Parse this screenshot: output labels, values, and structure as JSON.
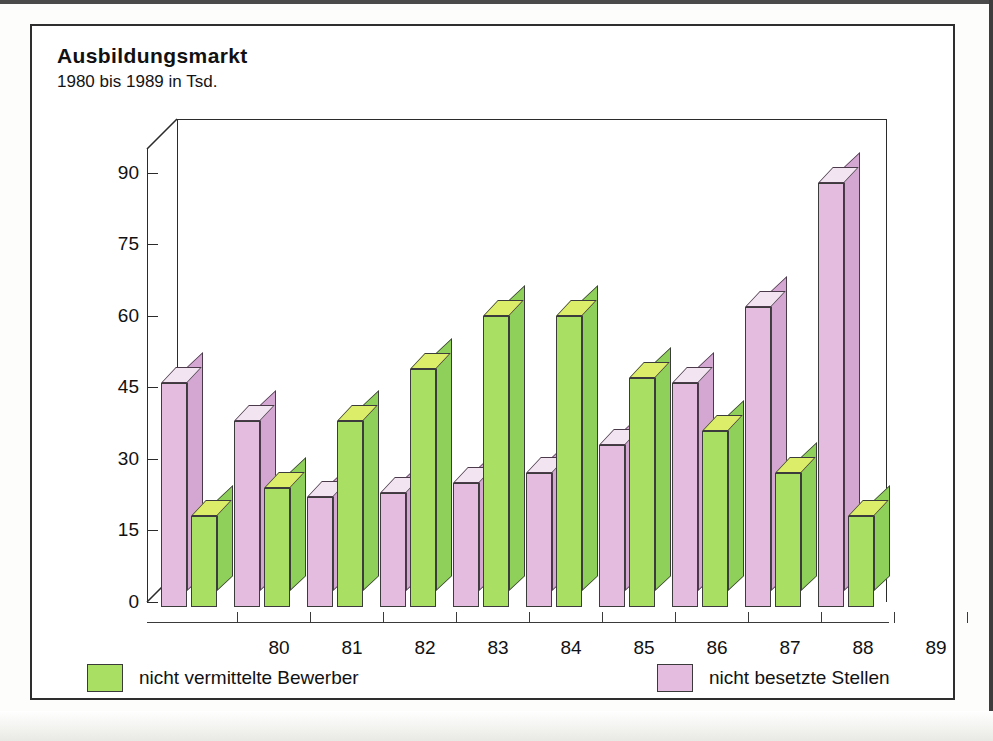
{
  "title": "Ausbildungsmarkt",
  "subtitle": "1980 bis 1989 in Tsd.",
  "legend": {
    "items": [
      {
        "label": "nicht vermittelte Bewerber",
        "color": "#a9e063",
        "key": "bewerber"
      },
      {
        "label": "nicht besetzte Stellen",
        "color": "#e3bce0",
        "key": "stellen"
      }
    ]
  },
  "chart_data": {
    "type": "bar",
    "title": "Ausbildungsmarkt",
    "subtitle": "1980 bis 1989 in Tsd.",
    "xlabel": "",
    "ylabel": "",
    "unit": "Tsd.",
    "grid": false,
    "legend_position": "bottom",
    "style": "3d-grouped-bar",
    "ylim": [
      0,
      95
    ],
    "yticks": [
      0,
      15,
      30,
      45,
      60,
      75,
      90
    ],
    "ytick_labels": [
      "0",
      "15",
      "30",
      "45",
      "60",
      "75",
      "90"
    ],
    "categories": [
      "80",
      "81",
      "82",
      "83",
      "84",
      "85",
      "86",
      "87",
      "88",
      "89"
    ],
    "category_full_years": [
      1980,
      1981,
      1982,
      1983,
      1984,
      1985,
      1986,
      1987,
      1988,
      1989
    ],
    "series": [
      {
        "name": "nicht besetzte Stellen",
        "color": "#e3bce0",
        "top_color": "#f2e4f1",
        "side_color": "#d3a7d2",
        "order": 1,
        "values": [
          47,
          39,
          23,
          24,
          26,
          28,
          34,
          47,
          63,
          89
        ]
      },
      {
        "name": "nicht vermittelte Bewerber",
        "color": "#a9e063",
        "top_color": "#dced6a",
        "side_color": "#8fd05a",
        "order": 2,
        "values": [
          19,
          25,
          39,
          50,
          61,
          61,
          48,
          37,
          28,
          19
        ]
      }
    ]
  }
}
